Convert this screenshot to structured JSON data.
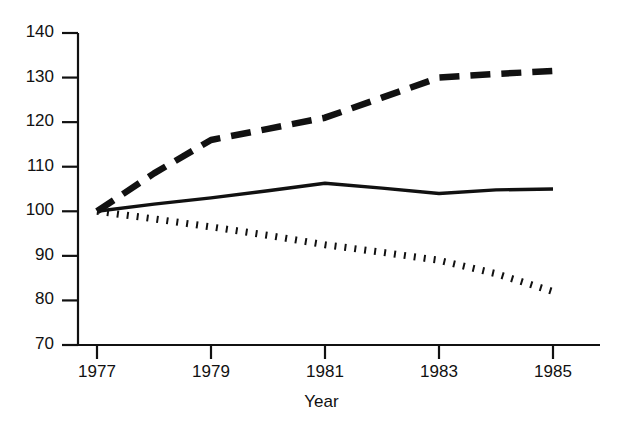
{
  "chart_data": {
    "type": "line",
    "title": "",
    "subtitle": "",
    "xlabel": "Year",
    "ylabel": "",
    "x": [
      1977,
      1978,
      1979,
      1980,
      1981,
      1982,
      1983,
      1984,
      1985
    ],
    "categories": [
      "1977",
      "1978",
      "1979",
      "1980",
      "1981",
      "1982",
      "1983",
      "1984",
      "1985"
    ],
    "xlim": [
      1976.5,
      1985
    ],
    "ylim": [
      70,
      140
    ],
    "xticks": [
      1977,
      1979,
      1981,
      1983,
      1985
    ],
    "xtick_labels": [
      "1977",
      "1979",
      "1981",
      "1983",
      "1985"
    ],
    "yticks": [
      70,
      80,
      90,
      100,
      110,
      120,
      130,
      140
    ],
    "ytick_labels": [
      "70",
      "80",
      "90",
      "100",
      "110",
      "120",
      "130",
      "140"
    ],
    "grid": false,
    "legend": "none",
    "series": [
      {
        "name": "dashed-series",
        "style": "dashed",
        "color": "#111111",
        "values": [
          100,
          108.5,
          116,
          118.5,
          121,
          125.5,
          130,
          130.8,
          131.5
        ]
      },
      {
        "name": "solid-series",
        "style": "solid",
        "color": "#111111",
        "values": [
          100,
          101.6,
          103,
          104.6,
          106.3,
          105.2,
          104,
          104.8,
          105
        ]
      },
      {
        "name": "dotted-series",
        "style": "dotted",
        "color": "#111111",
        "values": [
          100,
          98.3,
          96.5,
          94.6,
          92.5,
          90.8,
          89,
          86,
          82
        ]
      }
    ]
  },
  "axis": {
    "x_title": "Year"
  }
}
